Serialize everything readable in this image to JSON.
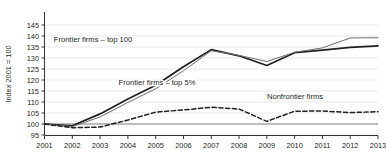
{
  "chart_data": {
    "type": "line",
    "title": "",
    "xlabel": "",
    "ylabel": "Index 2001 = 100",
    "x": [
      2001,
      2002,
      2003,
      2004,
      2005,
      2006,
      2007,
      2008,
      2009,
      2010,
      2011,
      2012,
      2013
    ],
    "xticklabels": [
      "2001",
      "2002",
      "2003",
      "2004",
      "2005",
      "2006",
      "2007",
      "2008",
      "2009",
      "2010",
      "2011",
      "2012",
      "2013"
    ],
    "yticklabels": [
      "95",
      "100",
      "105",
      "110",
      "115",
      "120",
      "125",
      "130",
      "135",
      "140",
      "145"
    ],
    "yticks": [
      95,
      100,
      105,
      110,
      115,
      120,
      125,
      130,
      135,
      140,
      145
    ],
    "ylim": [
      95,
      145
    ],
    "xlim": [
      2001,
      2013
    ],
    "grid": true,
    "legend_position": "inline-annotations",
    "series": [
      {
        "name": "Frontier firms – top 100",
        "style": "solid-thick",
        "color": "#231f20",
        "values": [
          100.0,
          99.2,
          104.6,
          111.4,
          117.6,
          126.0,
          133.8,
          131.0,
          126.6,
          132.4,
          133.6,
          134.8,
          135.5
        ]
      },
      {
        "name": "Frontier firms – top 5%",
        "style": "solid-thin",
        "color": "#6d6e71",
        "values": [
          100.0,
          98.8,
          103.2,
          109.8,
          116.0,
          124.2,
          133.3,
          131.2,
          128.4,
          132.6,
          134.6,
          139.1,
          139.2
        ]
      },
      {
        "name": "Nonfrontier firms",
        "style": "dashed",
        "color": "#231f20",
        "values": [
          100.0,
          98.3,
          98.6,
          101.8,
          105.4,
          106.4,
          107.6,
          106.8,
          101.2,
          105.8,
          105.9,
          105.2,
          105.6
        ]
      }
    ],
    "annotations": [
      {
        "text": "Frontier firms – top 100",
        "x_px": 93,
        "y_px": 42
      },
      {
        "text": "Frontier firms – top 5%",
        "x_px": 157,
        "y_px": 85
      },
      {
        "text": "Nonfrontier firms",
        "x_px": 295,
        "y_px": 99
      }
    ]
  }
}
